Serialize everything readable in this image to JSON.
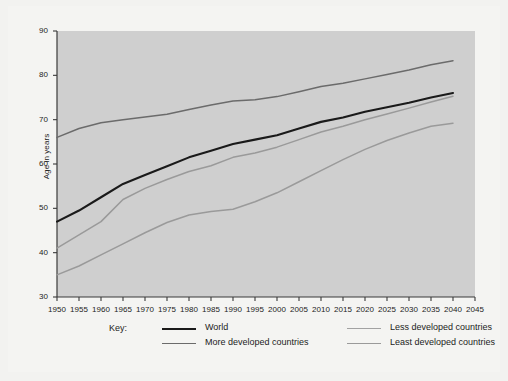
{
  "chart_data": {
    "type": "line",
    "title": "",
    "xlabel": "",
    "ylabel": "Age in years",
    "xlim": [
      1950,
      2045
    ],
    "ylim": [
      30,
      90
    ],
    "grid": false,
    "legend_position": "bottom",
    "legend_title": "Key:",
    "x_ticks": [
      1950,
      1955,
      1960,
      1965,
      1970,
      1975,
      1980,
      1985,
      1990,
      1995,
      2000,
      2005,
      2010,
      2015,
      2020,
      2025,
      2030,
      2035,
      2040,
      2045
    ],
    "y_ticks": [
      30,
      40,
      50,
      60,
      70,
      80,
      90
    ],
    "x": [
      1950,
      1955,
      1960,
      1965,
      1970,
      1975,
      1980,
      1985,
      1990,
      1995,
      2000,
      2005,
      2010,
      2015,
      2020,
      2025,
      2030,
      2035,
      2040
    ],
    "series": [
      {
        "name": "World",
        "color": "#1a1a1a",
        "width": 2.1,
        "values": [
          47.0,
          49.5,
          52.5,
          55.5,
          57.5,
          59.5,
          61.5,
          63.0,
          64.5,
          65.5,
          66.5,
          68.0,
          69.5,
          70.5,
          71.8,
          72.8,
          73.8,
          75.0,
          76.0
        ]
      },
      {
        "name": "More developed countries",
        "color": "#6b6b6b",
        "width": 1.5,
        "values": [
          66.0,
          68.0,
          69.3,
          70.0,
          70.6,
          71.2,
          72.3,
          73.3,
          74.2,
          74.5,
          75.2,
          76.3,
          77.5,
          78.2,
          79.2,
          80.2,
          81.2,
          82.4,
          83.3
        ]
      },
      {
        "name": "Less developed countries",
        "color": "#9a9a9a",
        "width": 1.5,
        "values": [
          41.0,
          44.0,
          47.0,
          52.0,
          54.5,
          56.5,
          58.3,
          59.6,
          61.5,
          62.5,
          63.8,
          65.5,
          67.2,
          68.5,
          70.0,
          71.3,
          72.6,
          74.0,
          75.3
        ]
      },
      {
        "name": "Least developed countries",
        "color": "#9a9a9a",
        "width": 1.5,
        "values": [
          35.0,
          37.0,
          39.5,
          42.0,
          44.5,
          46.8,
          48.5,
          49.3,
          49.8,
          51.5,
          53.5,
          56.0,
          58.5,
          61.0,
          63.3,
          65.3,
          67.0,
          68.5,
          69.2
        ]
      }
    ]
  },
  "legend": {
    "title": "Key:",
    "entries": [
      {
        "label": "World",
        "color": "#1a1a1a",
        "width": 2.6,
        "col": 0,
        "row": 0
      },
      {
        "label": "More developed countries",
        "color": "#6b6b6b",
        "width": 1.6,
        "col": 0,
        "row": 1
      },
      {
        "label": "Less developed countries",
        "color": "#a2a2a2",
        "width": 1.6,
        "col": 1,
        "row": 0
      },
      {
        "label": "Least developed countries",
        "color": "#9a9a9a",
        "width": 1.6,
        "col": 1,
        "row": 1
      }
    ]
  },
  "colors": {
    "page_background": "#f4f4f2",
    "plot_background": "#cfcfcf",
    "axis": "#3a3a3a",
    "text": "#1c1c1c"
  }
}
